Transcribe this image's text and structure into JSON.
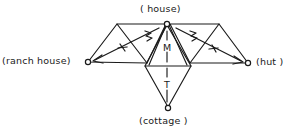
{
  "figure": {
    "type": "geometric-semantic-diagram",
    "background_color": "#ffffff",
    "stroke_color": "#1a1a1a",
    "nodes": [
      {
        "id": "house",
        "label": "( house)",
        "x": 167,
        "y": 23,
        "marker": "open-circle"
      },
      {
        "id": "ranch-house",
        "label": "(ranch house)",
        "x": 88,
        "y": 62,
        "marker": "open-circle"
      },
      {
        "id": "hut",
        "label": "(hut )",
        "x": 248,
        "y": 63,
        "marker": "open-circle"
      },
      {
        "id": "cottage",
        "label": "(cottage )",
        "x": 168,
        "y": 108,
        "marker": "open-circle"
      }
    ],
    "axis": {
      "style": "dashed-vertical",
      "from_node": "house",
      "to_node": "cottage",
      "labels": [
        {
          "text": "M",
          "position": "upper"
        },
        {
          "text": "T",
          "position": "lower"
        }
      ]
    },
    "diagonal_vectors": [
      {
        "id": "left-vector",
        "from_node": "house",
        "to_node": "ranch-house",
        "tick_labels": [
          "M",
          "T"
        ]
      },
      {
        "id": "right-vector",
        "from_node": "house",
        "to_node": "hut",
        "tick_labels": [
          "M",
          "T"
        ]
      }
    ]
  }
}
